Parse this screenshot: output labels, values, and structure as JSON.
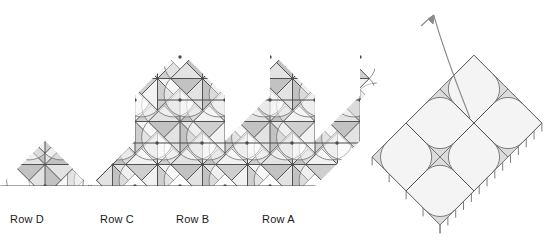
{
  "figure": {
    "title": "",
    "type": "geometric-tessellation-diagram",
    "canvas": {
      "width": 552,
      "height": 248,
      "background": "#ffffff"
    },
    "colors": {
      "stroke_dark": "#4a4a4a",
      "stroke_mid": "#777777",
      "stroke_light": "#9a9a9a",
      "fill_light": "#f2f2f2",
      "fill_mid": "#e3e3e3",
      "fill_dark": "#cfcfcf",
      "fill_darker": "#c2c2c2",
      "strip_fill": "#f4f4f4",
      "strip_arc_fill": "#dcdcdc",
      "label_color": "#1a1a1a"
    },
    "labels": [
      {
        "text": "Row D",
        "x": 10,
        "y": 222
      },
      {
        "text": "Row C",
        "x": 100,
        "y": 222
      },
      {
        "text": "Row B",
        "x": 176,
        "y": 222
      },
      {
        "text": "Row A",
        "x": 262,
        "y": 222
      }
    ],
    "tessellation": {
      "description": "zigzag band of 45-degree rotated squares with full diagonals, midlines and quarter-circle arcs forming eight-point star nodes",
      "cell_size": 45,
      "node_rows_y": [
        57,
        100,
        143,
        186
      ],
      "node_spacing_x": 45,
      "peaks_count": 4,
      "bottom_apex_count": 4
    },
    "strip": {
      "description": "folded module: rotated rectangular strip of squares with quarter-circle arcs at the corners and hatch ticks along the lower-left edge",
      "rotation_deg": -45,
      "cells": 6,
      "hatch_ticks": 14
    },
    "arrow": {
      "description": "curved arrow rising from the strip toward the upper left",
      "tip": {
        "x": 434,
        "y": 14
      }
    }
  }
}
